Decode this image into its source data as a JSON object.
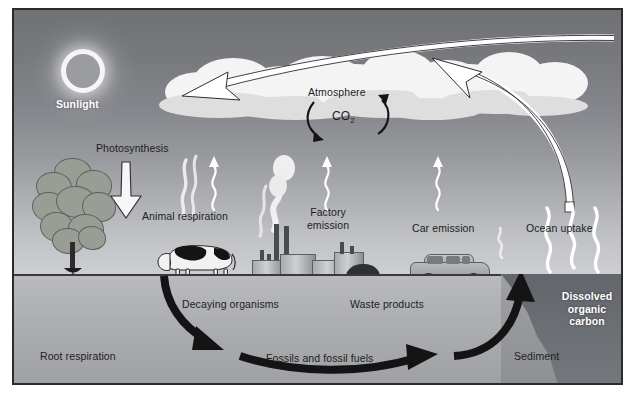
{
  "figure": {
    "colors": {
      "sky_top": "#6f7175",
      "sky_bottom": "#cdced1",
      "ground": "#b9babd",
      "ocean_water": "#62656a",
      "arrow_black": "#141414",
      "arrow_white": "#ffffff",
      "label_dark": "#1d1d1d",
      "label_light": "#ffffff",
      "frame_border": "#2b2b2b"
    }
  },
  "labels": {
    "sunlight": "Sunlight",
    "photosynthesis": "Photosynthesis",
    "atmosphere": "Atmosphere",
    "co2": "CO",
    "co2_sub": "2",
    "animal_respiration": "Animal respiration",
    "factory_emission": "Factory\nemission",
    "car_emission": "Car emission",
    "ocean_uptake": "Ocean uptake",
    "root_respiration": "Root respiration",
    "decaying_organisms": "Decaying organisms",
    "waste_products": "Waste products",
    "fossils_and_fossil_fuels": "Fossils and fossil fuels",
    "dissolved_organic_carbon": "Dissolved\norganic\ncarbon",
    "sediment": "Sediment"
  },
  "elements": {
    "sun": "sun-icon",
    "clouds": "cloud-bank",
    "tree": "tree-illustration",
    "cow": "cow-illustration",
    "factory": "factory-illustration",
    "car": "car-illustration",
    "coal_pile": "coal-pile",
    "ocean": "ocean-water",
    "sediment_slope": "sediment-slope"
  },
  "arrows": {
    "sunlight_to_clouds": "white-curved-arrow-left",
    "ocean_to_atmosphere": "white-curved-arrow-up",
    "photosynthesis_down": "white-block-arrow-down",
    "co2_cycle_left": "black-arc-arrow-down",
    "co2_cycle_right": "black-arc-arrow-up",
    "decay_down": "black-curved-arrow-down",
    "fossils_right": "black-curved-arrow-right",
    "sediment_up": "black-curved-arrow-up"
  },
  "emissions": {
    "animal": "white-smoke-wisp",
    "animal_squiggle": "white-wavy-arrow-up",
    "factory_smoke": "white-smoke-plume",
    "factory_squiggle": "white-wavy-arrow-up",
    "car_squiggle": "white-wavy-arrow-up",
    "car_exhaust": "white-wavy-arrow-up",
    "ocean_wave_1": "white-wavy-line",
    "ocean_wave_2": "white-wavy-line",
    "ocean_wave_3": "white-wavy-line"
  }
}
